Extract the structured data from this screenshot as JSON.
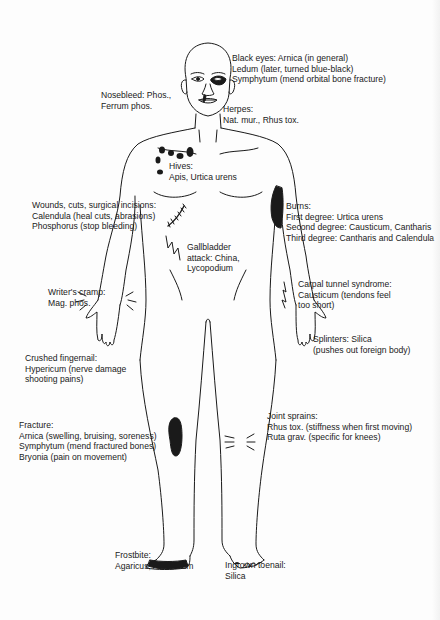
{
  "diagram": {
    "type": "anatomical-remedy-chart",
    "ink_color": "#1a1a1a",
    "background": "#fdfdfd",
    "labels": {
      "black_eyes": [
        "Black eyes: Arnica (in general)",
        "Ledum (later, turned blue-black)",
        "Symphytum (mend orbital bone fracture)"
      ],
      "nosebleed": [
        "Nosebleed:  Phos.,",
        "Ferrum phos."
      ],
      "herpes": [
        "Herpes:",
        "Nat. mur., Rhus tox."
      ],
      "hives": [
        "Hives:",
        "Apis, Urtica urens"
      ],
      "wounds": [
        "Wounds, cuts, surgical incisions:",
        "Calendula (heal cuts, abrasions)",
        "Phosphorus (stop bleeding)"
      ],
      "burns": [
        "Burns:",
        "First degree: Urtica urens",
        "Second degree: Causticum, Cantharis",
        "Third degree: Cantharis and Calendula"
      ],
      "gallbladder": [
        "Gallbladder",
        "attack:  China,",
        "Lycopodium"
      ],
      "writers_cramp": [
        "Writer's cramp:",
        "Mag. phos."
      ],
      "carpal_tunnel": [
        "Carpal tunnel syndrome:",
        "Causticum (tendons feel",
        "too short)"
      ],
      "splinters": [
        "Splinters:  Silica",
        "(pushes out foreign body)"
      ],
      "crushed_fingernail": [
        "Crushed fingernail:",
        "Hypericum (nerve damage",
        "shooting pains)"
      ],
      "fracture": [
        "Fracture:",
        "Arnica (swelling, bruising, soreness)",
        "Symphytum (mend fractured bones)",
        "Bryonia (pain on movement)"
      ],
      "joint_sprains": [
        "Joint sprains:",
        "Rhus tox. (stiffness when first moving)",
        "Ruta grav. (specific for knees)"
      ],
      "frostbite": [
        "Frostbite:",
        "Agaricus, Arsenicum"
      ],
      "ingrown_toenail": [
        "Ingrown toenail:",
        "Silica"
      ]
    }
  }
}
